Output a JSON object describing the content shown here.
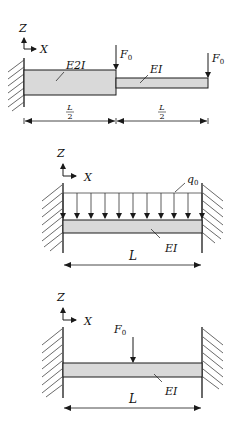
{
  "colors": {
    "stroke": "#1a1a1a",
    "beam_fill": "#d9d9d9",
    "background": "#ffffff"
  },
  "figure1": {
    "axis_z": "Z",
    "axis_x": "X",
    "segment1_label": "E2I",
    "segment2_label": "EI",
    "force1_label": "F",
    "force1_sub": "0",
    "force2_label": "F",
    "force2_sub": "0",
    "dim1_num": "L",
    "dim1_den": "2",
    "dim2_num": "L",
    "dim2_den": "2",
    "support": "fixed-left-wall"
  },
  "figure2": {
    "axis_z": "Z",
    "axis_x": "X",
    "load_label": "q",
    "load_sub": "0",
    "beam_label": "EI",
    "dim_label": "L",
    "support": "fixed-both-ends",
    "load_type": "uniform distributed load"
  },
  "figure3": {
    "axis_z": "Z",
    "axis_x": "X",
    "force_label": "F",
    "force_sub": "0",
    "beam_label": "EI",
    "dim_label": "L",
    "support": "fixed-both-ends",
    "load_type": "point load at midspan"
  }
}
